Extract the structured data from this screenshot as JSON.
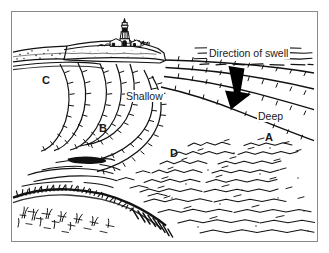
{
  "figure": {
    "kind": "line-diagram",
    "background_color": "#ffffff",
    "ink_color": "#000000",
    "frame_color": "#8a8a8a"
  },
  "labels": {
    "direction_of_swell": "Direction of swell",
    "shallow": "Shallow",
    "deep": "Deep",
    "a": "A",
    "b": "B",
    "c": "C",
    "d": "D"
  },
  "scene": {
    "lighthouse": "lighthouse-icon",
    "headland": "headland-cliff",
    "swell_arrow": "down-arrow-icon",
    "foreground": "grassy-shore-foreground",
    "water": "choppy-water-texture"
  }
}
